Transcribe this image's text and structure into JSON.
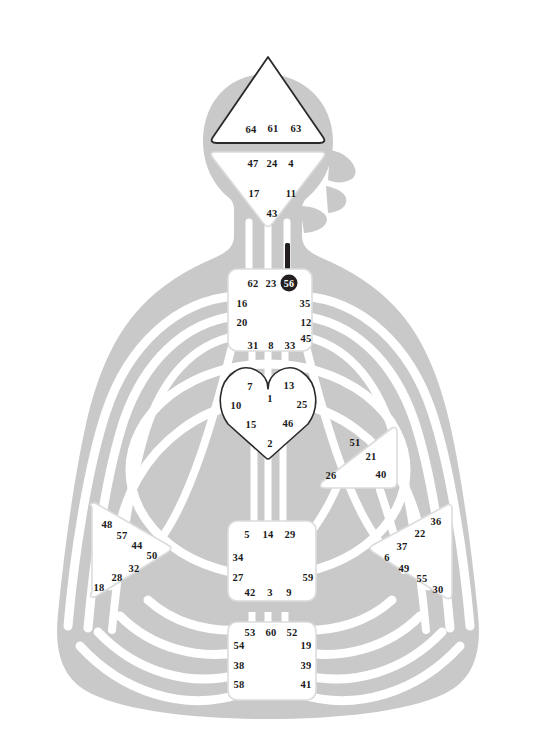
{
  "chart": {
    "type": "diagram",
    "body_color": "#c9c9c9",
    "channel_color": "#ffffff",
    "center_fill": "#ffffff",
    "center_stroke": "#d8d8d8",
    "head_stroke": "#2a2a2a",
    "gate_text_color": "#1a1a1a",
    "activated_fill": "#231f20",
    "activated_text_color": "#ffffff"
  },
  "centers": {
    "head": {
      "name": "Head",
      "shape": "triangle-up",
      "gates": [
        {
          "id": "g64",
          "num": "64",
          "x": 251,
          "y": 129
        },
        {
          "id": "g61",
          "num": "61",
          "x": 273,
          "y": 128
        },
        {
          "id": "g63",
          "num": "63",
          "x": 296,
          "y": 128
        }
      ]
    },
    "ajna": {
      "name": "Ajna",
      "shape": "triangle-down",
      "gates": [
        {
          "id": "g47",
          "num": "47",
          "x": 253,
          "y": 163
        },
        {
          "id": "g24",
          "num": "24",
          "x": 272,
          "y": 163
        },
        {
          "id": "g4",
          "num": "4",
          "x": 291,
          "y": 163
        },
        {
          "id": "g17",
          "num": "17",
          "x": 254,
          "y": 193
        },
        {
          "id": "g11",
          "num": "11",
          "x": 291,
          "y": 193
        },
        {
          "id": "g43",
          "num": "43",
          "x": 272,
          "y": 213
        }
      ]
    },
    "throat": {
      "name": "Throat",
      "shape": "square",
      "gates": [
        {
          "id": "g62",
          "num": "62",
          "x": 253,
          "y": 283
        },
        {
          "id": "g23",
          "num": "23",
          "x": 271,
          "y": 283
        },
        {
          "id": "g56",
          "num": "56",
          "x": 289,
          "y": 283,
          "activated": true
        },
        {
          "id": "g16",
          "num": "16",
          "x": 242,
          "y": 303
        },
        {
          "id": "g35",
          "num": "35",
          "x": 305,
          "y": 303
        },
        {
          "id": "g20",
          "num": "20",
          "x": 242,
          "y": 322
        },
        {
          "id": "g12",
          "num": "12",
          "x": 306,
          "y": 322
        },
        {
          "id": "g45",
          "num": "45",
          "x": 306,
          "y": 338
        },
        {
          "id": "g31",
          "num": "31",
          "x": 253,
          "y": 345
        },
        {
          "id": "g8",
          "num": "8",
          "x": 271,
          "y": 345
        },
        {
          "id": "g33",
          "num": "33",
          "x": 290,
          "y": 345
        }
      ]
    },
    "g_center": {
      "name": "G Center",
      "shape": "heart",
      "gates": [
        {
          "id": "g7",
          "num": "7",
          "x": 250,
          "y": 386
        },
        {
          "id": "g13",
          "num": "13",
          "x": 289,
          "y": 385
        },
        {
          "id": "g1",
          "num": "1",
          "x": 270,
          "y": 398
        },
        {
          "id": "g10",
          "num": "10",
          "x": 236,
          "y": 405
        },
        {
          "id": "g25",
          "num": "25",
          "x": 302,
          "y": 404
        },
        {
          "id": "g15",
          "num": "15",
          "x": 251,
          "y": 424
        },
        {
          "id": "g46",
          "num": "46",
          "x": 288,
          "y": 423
        },
        {
          "id": "g2",
          "num": "2",
          "x": 270,
          "y": 443
        }
      ]
    },
    "ego": {
      "name": "Ego / Heart",
      "shape": "triangle-left",
      "gates": [
        {
          "id": "g51",
          "num": "51",
          "x": 355,
          "y": 442
        },
        {
          "id": "g21",
          "num": "21",
          "x": 371,
          "y": 456
        },
        {
          "id": "g26",
          "num": "26",
          "x": 331,
          "y": 475
        },
        {
          "id": "g40",
          "num": "40",
          "x": 381,
          "y": 474
        }
      ]
    },
    "spleen": {
      "name": "Spleen",
      "shape": "triangle-right",
      "gates": [
        {
          "id": "g48",
          "num": "48",
          "x": 107,
          "y": 524
        },
        {
          "id": "g57",
          "num": "57",
          "x": 122,
          "y": 535
        },
        {
          "id": "g44",
          "num": "44",
          "x": 137,
          "y": 545
        },
        {
          "id": "g50",
          "num": "50",
          "x": 152,
          "y": 555
        },
        {
          "id": "g32",
          "num": "32",
          "x": 134,
          "y": 568
        },
        {
          "id": "g28",
          "num": "28",
          "x": 117,
          "y": 577
        },
        {
          "id": "g18",
          "num": "18",
          "x": 99,
          "y": 587
        }
      ]
    },
    "sacral": {
      "name": "Sacral",
      "shape": "square",
      "gates": [
        {
          "id": "g5",
          "num": "5",
          "x": 247,
          "y": 534
        },
        {
          "id": "g14",
          "num": "14",
          "x": 268,
          "y": 534
        },
        {
          "id": "g29",
          "num": "29",
          "x": 290,
          "y": 534
        },
        {
          "id": "g34",
          "num": "34",
          "x": 238,
          "y": 557
        },
        {
          "id": "g27",
          "num": "27",
          "x": 238,
          "y": 577
        },
        {
          "id": "g59",
          "num": "59",
          "x": 308,
          "y": 577
        },
        {
          "id": "g42",
          "num": "42",
          "x": 250,
          "y": 592
        },
        {
          "id": "g3",
          "num": "3",
          "x": 270,
          "y": 592
        },
        {
          "id": "g9",
          "num": "9",
          "x": 289,
          "y": 592
        }
      ]
    },
    "solar_plexus": {
      "name": "Solar Plexus",
      "shape": "triangle-left",
      "gates": [
        {
          "id": "g36",
          "num": "36",
          "x": 436,
          "y": 521
        },
        {
          "id": "g22",
          "num": "22",
          "x": 420,
          "y": 533
        },
        {
          "id": "g37",
          "num": "37",
          "x": 402,
          "y": 546
        },
        {
          "id": "g6",
          "num": "6",
          "x": 387,
          "y": 557
        },
        {
          "id": "g49",
          "num": "49",
          "x": 404,
          "y": 568
        },
        {
          "id": "g55",
          "num": "55",
          "x": 422,
          "y": 578
        },
        {
          "id": "g30",
          "num": "30",
          "x": 438,
          "y": 589
        }
      ]
    },
    "root": {
      "name": "Root",
      "shape": "square",
      "gates": [
        {
          "id": "g53",
          "num": "53",
          "x": 250,
          "y": 632
        },
        {
          "id": "g60",
          "num": "60",
          "x": 271,
          "y": 632
        },
        {
          "id": "g52",
          "num": "52",
          "x": 292,
          "y": 632
        },
        {
          "id": "g54",
          "num": "54",
          "x": 239,
          "y": 645
        },
        {
          "id": "g19",
          "num": "19",
          "x": 306,
          "y": 645
        },
        {
          "id": "g38",
          "num": "38",
          "x": 239,
          "y": 665
        },
        {
          "id": "g39",
          "num": "39",
          "x": 306,
          "y": 665
        },
        {
          "id": "g58",
          "num": "58",
          "x": 239,
          "y": 684
        },
        {
          "id": "g41",
          "num": "41",
          "x": 306,
          "y": 684
        }
      ]
    }
  },
  "activated_channels": [
    {
      "id": "ch-56-throat",
      "from": "56",
      "to": "throat",
      "color": "#231f20"
    }
  ]
}
